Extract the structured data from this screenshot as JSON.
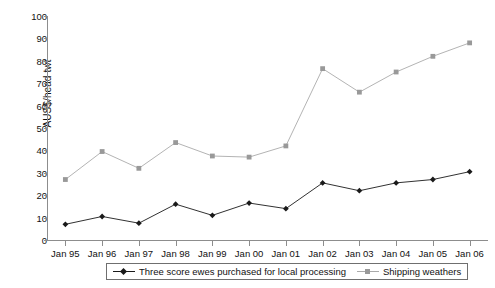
{
  "chart_data": {
    "type": "line",
    "title": "",
    "xlabel": "",
    "ylabel": "AUS$/head twt",
    "ylim": [
      0,
      100
    ],
    "yticks": [
      0,
      10,
      20,
      30,
      40,
      50,
      60,
      70,
      80,
      90,
      100
    ],
    "grid": false,
    "legend_position": "bottom",
    "categories": [
      "Jan 95",
      "Jan 96",
      "Jan 97",
      "Jan 98",
      "Jan 99",
      "Jan 00",
      "Jan 01",
      "Jan 02",
      "Jan 03",
      "Jan 04",
      "Jan 05",
      "Jan 06"
    ],
    "series": [
      {
        "name": "Three score ewes purchased for local processing",
        "color": "#1a1a1a",
        "marker": "diamond",
        "values": [
          7,
          10.5,
          7.5,
          16,
          11,
          16.5,
          14,
          25.5,
          22,
          25.5,
          27,
          30.5
        ]
      },
      {
        "name": "Shipping weathers",
        "color": "#999999",
        "marker": "square",
        "values": [
          27,
          39.5,
          32,
          43.5,
          37.5,
          37,
          42,
          76.5,
          66,
          75,
          82,
          88
        ]
      }
    ]
  },
  "axis": {
    "y_title": "AUS$/head twt"
  },
  "legend": {
    "items": [
      {
        "label": "Three score ewes purchased for local processing"
      },
      {
        "label": "Shipping weathers"
      }
    ]
  },
  "colors": {
    "series_1": "#1a1a1a",
    "series_2": "#999999",
    "axis": "#8d8d8d",
    "legend_border": "#6f6f6f"
  }
}
